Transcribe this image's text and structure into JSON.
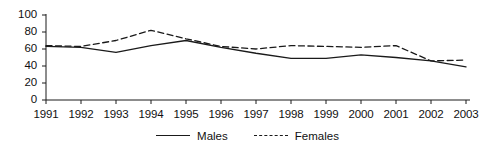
{
  "chart_data": {
    "type": "line",
    "title": "",
    "xlabel": "",
    "ylabel": "",
    "categories": [
      "1991",
      "1992",
      "1993",
      "1994",
      "1995",
      "1996",
      "1997",
      "1998",
      "1999",
      "2000",
      "2001",
      "2002",
      "2003"
    ],
    "series": [
      {
        "name": "Males",
        "style": "solid",
        "color": "#1a1a1a",
        "values": [
          63,
          62,
          56,
          64,
          70,
          62,
          55,
          49,
          49,
          53,
          50,
          46,
          39
        ]
      },
      {
        "name": "Females",
        "style": "dashed",
        "color": "#1a1a1a",
        "values": [
          64,
          63,
          70,
          82,
          72,
          63,
          60,
          64,
          63,
          62,
          64,
          46,
          47
        ]
      }
    ],
    "ylim": [
      0,
      100
    ],
    "yticks": [
      0,
      20,
      40,
      60,
      80,
      100
    ],
    "ytick_labels": [
      "0",
      "20",
      "40",
      "60",
      "80",
      "100"
    ],
    "grid": false,
    "legend_position": "bottom-center"
  },
  "legend": {
    "entries": [
      {
        "label": "Males",
        "style": "solid"
      },
      {
        "label": "Females",
        "style": "dashed"
      }
    ]
  }
}
